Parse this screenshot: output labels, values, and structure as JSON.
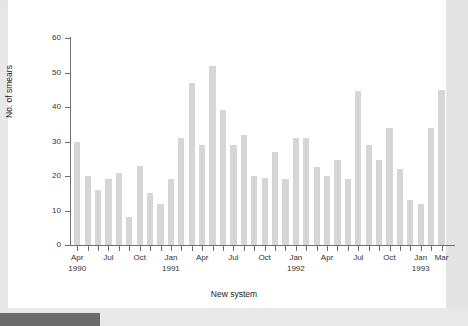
{
  "figure": {
    "y_axis_title": "No. of smears",
    "x_axis_title": "New system"
  },
  "colors": {
    "bar_fill": "#d6d6d6",
    "axis": "#6e6e6e",
    "plot_background": "#ffffff",
    "page_background": "#e8e8e8",
    "scrollbar_thumb": "#6b6b6b",
    "scrollbar_track": "#e9e9e9"
  },
  "chart_data": {
    "type": "bar",
    "title": "",
    "subtitle": "",
    "xlabel": "New system",
    "ylabel": "No. of smears",
    "ylim": [
      0,
      60
    ],
    "yticks": [
      0,
      10,
      20,
      30,
      40,
      50,
      60
    ],
    "ytick_labels": [
      "0",
      "10",
      "20",
      "30",
      "40",
      "50",
      "60"
    ],
    "grid": false,
    "legend": null,
    "categories": [
      "Apr 1990",
      "May 1990",
      "Jun 1990",
      "Jul 1990",
      "Aug 1990",
      "Sep 1990",
      "Oct 1990",
      "Nov 1990",
      "Dec 1990",
      "Jan 1991",
      "Feb 1991",
      "Mar 1991",
      "Apr 1991",
      "May 1991",
      "Jun 1991",
      "Jul 1991",
      "Aug 1991",
      "Sep 1991",
      "Oct 1991",
      "Nov 1991",
      "Dec 1991",
      "Jan 1992",
      "Feb 1992",
      "Mar 1992",
      "Apr 1992",
      "May 1992",
      "Jun 1992",
      "Jul 1992",
      "Aug 1992",
      "Sep 1992",
      "Oct 1992",
      "Nov 1992",
      "Dec 1992",
      "Jan 1993",
      "Feb 1993",
      "Mar 1993"
    ],
    "values": [
      30,
      20,
      16,
      19,
      21,
      8,
      23,
      15,
      12,
      19,
      31,
      47,
      29,
      52,
      39,
      29,
      32,
      20,
      19.5,
      27,
      19,
      31,
      31,
      22.5,
      20,
      24.5,
      19,
      44.5,
      29,
      24.5,
      34,
      22,
      13,
      12,
      34,
      45
    ],
    "xtick_labels": [
      {
        "index": 0,
        "month": "Apr",
        "year": "1990"
      },
      {
        "index": 3,
        "month": "Jul",
        "year": ""
      },
      {
        "index": 6,
        "month": "Oct",
        "year": ""
      },
      {
        "index": 9,
        "month": "Jan",
        "year": "1991"
      },
      {
        "index": 12,
        "month": "Apr",
        "year": ""
      },
      {
        "index": 15,
        "month": "Jul",
        "year": ""
      },
      {
        "index": 18,
        "month": "Oct",
        "year": ""
      },
      {
        "index": 21,
        "month": "Jan",
        "year": "1992"
      },
      {
        "index": 24,
        "month": "Apr",
        "year": ""
      },
      {
        "index": 27,
        "month": "Jul",
        "year": ""
      },
      {
        "index": 30,
        "month": "Oct",
        "year": ""
      },
      {
        "index": 33,
        "month": "Jan",
        "year": "1993"
      },
      {
        "index": 35,
        "month": "Mar",
        "year": ""
      }
    ]
  }
}
